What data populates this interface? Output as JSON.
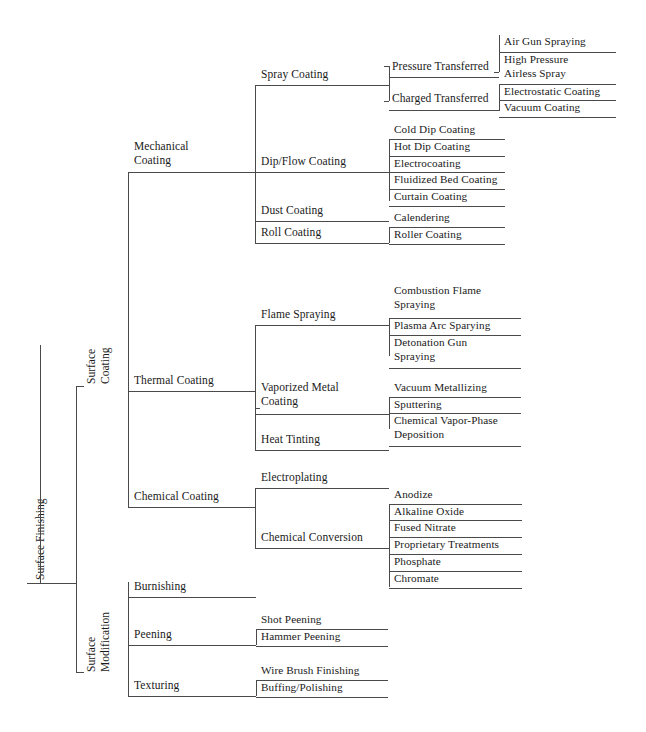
{
  "diagram": {
    "title": "Surface Finishing",
    "type": "hierarchy-tree",
    "orientation": "left-to-right",
    "line_color": "#4a4a4a",
    "text_color": "#1a1a1a",
    "background": "#ffffff"
  },
  "root": {
    "label": "Surface Finishing"
  },
  "level1": {
    "surface_coating": {
      "label": "Surface\nCoating"
    },
    "surface_modification": {
      "label": "Surface\nModification"
    }
  },
  "level2": {
    "mechanical_coating": {
      "label": "Mechanical\nCoating"
    },
    "thermal_coating": {
      "label": "Thermal Coating"
    },
    "chemical_coating": {
      "label": "Chemical Coating"
    },
    "burnishing": {
      "label": "Burnishing"
    },
    "peening": {
      "label": "Peening"
    },
    "texturing": {
      "label": "Texturing"
    }
  },
  "level3": {
    "spray_coating": {
      "label": "Spray Coating"
    },
    "dip_flow_coating": {
      "label": "Dip/Flow Coating"
    },
    "dust_coating": {
      "label": "Dust Coating"
    },
    "roll_coating": {
      "label": "Roll Coating"
    },
    "flame_spraying": {
      "label": "Flame Spraying"
    },
    "vaporized_metal_coating": {
      "label": "Vaporized Metal\nCoating"
    },
    "heat_tinting": {
      "label": "Heat Tinting"
    },
    "electroplating": {
      "label": "Electroplating"
    },
    "chemical_conversion": {
      "label": "Chemical Conversion"
    }
  },
  "level4": {
    "pressure_transferred": {
      "label": "Pressure Transferred"
    },
    "charged_transferred": {
      "label": "Charged Transferred"
    }
  },
  "leaves": {
    "pressure_transferred": [
      {
        "label": "Air Gun Spraying"
      },
      {
        "label": "High Pressure\nAirless Spray"
      }
    ],
    "charged_transferred": [
      {
        "label": "Electrostatic Coating"
      },
      {
        "label": "Vacuum Coating"
      }
    ],
    "dip_flow_coating": [
      {
        "label": "Cold Dip Coating"
      },
      {
        "label": "Hot Dip Coating"
      },
      {
        "label": "Electrocoating"
      },
      {
        "label": "Fluidized Bed Coating"
      },
      {
        "label": "Curtain Coating"
      }
    ],
    "roll_coating": [
      {
        "label": "Calendering"
      },
      {
        "label": "Roller Coating"
      }
    ],
    "flame_spraying": [
      {
        "label": "Combustion Flame\nSpraying"
      },
      {
        "label": "Plasma Arc Sparying"
      },
      {
        "label": "Detonation Gun\nSpraying"
      }
    ],
    "vaporized_metal_coating": [
      {
        "label": "Vacuum Metallizing"
      },
      {
        "label": "Sputtering"
      },
      {
        "label": "Chemical Vapor-Phase\nDeposition"
      }
    ],
    "chemical_conversion": [
      {
        "label": "Anodize"
      },
      {
        "label": "Alkaline Oxide"
      },
      {
        "label": "Fused Nitrate"
      },
      {
        "label": "Proprietary Treatments"
      },
      {
        "label": "Phosphate"
      },
      {
        "label": "Chromate"
      }
    ],
    "peening": [
      {
        "label": "Shot Peening"
      },
      {
        "label": "Hammer Peening"
      }
    ],
    "texturing": [
      {
        "label": "Wire Brush Finishing"
      },
      {
        "label": "Buffing/Polishing"
      }
    ]
  }
}
